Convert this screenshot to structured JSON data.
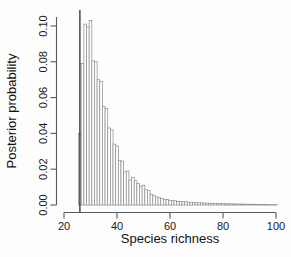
{
  "chart_data": {
    "type": "bar",
    "title": "",
    "subtitle": "",
    "xlabel": "Species richness",
    "ylabel": "Posterior probability",
    "xlim": [
      20,
      100
    ],
    "ylim": [
      0.0,
      0.105
    ],
    "xticks": [
      20,
      40,
      60,
      80,
      100
    ],
    "xtick_labels": [
      "20",
      "40",
      "60",
      "80",
      "100"
    ],
    "yticks": [
      0.0,
      0.02,
      0.04,
      0.06,
      0.08,
      0.1
    ],
    "ytick_labels": [
      "0.00",
      "0.02",
      "0.04",
      "0.06",
      "0.08",
      "0.10"
    ],
    "grid": false,
    "legend": null,
    "bin_width": 1,
    "annotations": [
      {
        "name": "observed-richness-vline",
        "type": "vertical-line",
        "x": 26,
        "color": "#2b2b2b"
      }
    ],
    "categories": [
      26,
      27,
      28,
      29,
      30,
      31,
      32,
      33,
      34,
      35,
      36,
      37,
      38,
      39,
      40,
      41,
      42,
      43,
      44,
      45,
      46,
      47,
      48,
      49,
      50,
      51,
      52,
      53,
      54,
      55,
      56,
      57,
      58,
      59,
      60,
      61,
      62,
      63,
      64,
      65,
      66,
      67,
      68,
      69,
      70,
      71,
      72,
      73,
      74,
      75,
      76,
      77,
      78,
      79,
      80,
      81,
      82,
      83,
      84,
      85,
      86,
      87,
      88,
      89,
      90,
      91,
      92,
      93,
      94,
      95,
      96,
      97,
      98,
      99,
      100
    ],
    "values": [
      0.04,
      0.079,
      0.101,
      0.0995,
      0.103,
      0.0805,
      0.08,
      0.07,
      0.069,
      0.055,
      0.054,
      0.043,
      0.042,
      0.034,
      0.033,
      0.025,
      0.0245,
      0.0185,
      0.019,
      0.014,
      0.0155,
      0.0135,
      0.012,
      0.0105,
      0.011,
      0.0085,
      0.008,
      0.006,
      0.0052,
      0.0045,
      0.004,
      0.0036,
      0.0032,
      0.003,
      0.0026,
      0.0025,
      0.0023,
      0.002,
      0.002,
      0.0018,
      0.0018,
      0.0016,
      0.0015,
      0.0014,
      0.0013,
      0.0012,
      0.0012,
      0.0011,
      0.001,
      0.001,
      0.0009,
      0.0009,
      0.0008,
      0.0008,
      0.0007,
      0.0007,
      0.0007,
      0.0006,
      0.0006,
      0.0006,
      0.0005,
      0.0005,
      0.0005,
      0.0004,
      0.0004,
      0.0004,
      0.0004,
      0.0003,
      0.0003,
      0.0003,
      0.0003,
      0.0002,
      0.0002,
      0.0002,
      0.0002
    ]
  }
}
